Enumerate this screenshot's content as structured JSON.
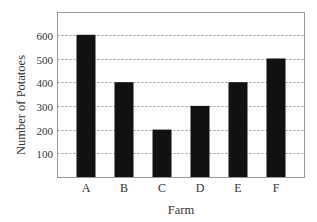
{
  "chart_data": {
    "type": "bar",
    "title": "",
    "xlabel": "Farm",
    "ylabel": "Number of Potatoes",
    "categories": [
      "A",
      "B",
      "C",
      "D",
      "E",
      "F"
    ],
    "values": [
      600,
      400,
      200,
      300,
      400,
      500
    ],
    "yticks": [
      100,
      200,
      300,
      400,
      500,
      600
    ],
    "ylim": [
      0,
      700
    ],
    "grid": "horizontal dashed",
    "legend": null,
    "bar_color": "#111111",
    "grid_color": "#999999",
    "frame_color": "#999999"
  }
}
